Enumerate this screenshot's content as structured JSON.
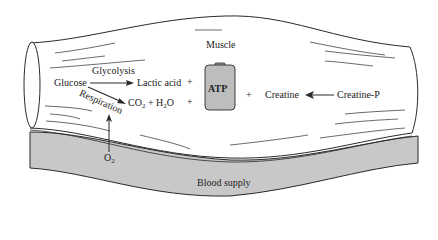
{
  "diagram": {
    "title": "Muscle",
    "colors": {
      "stroke": "#2a2a2a",
      "blood_fill": "#c8c8c8",
      "battery_fill": "#bdbdbd",
      "background": "#ffffff"
    },
    "labels": {
      "muscle": "Muscle",
      "glucose": "Glucose",
      "glycolysis": "Glycolysis",
      "lactic_acid": "Lactic acid",
      "respiration": "Respiration",
      "co2": "CO",
      "co2_sub": "2",
      "plus_h2o": " + H",
      "h2o_sub": "2",
      "h2o_tail": "O",
      "plus": "+",
      "atp": "ATP",
      "creatine": "Creatine",
      "creatine_p": "Creatine-P",
      "o2": "O",
      "o2_sub": "2",
      "blood_supply": "Blood supply"
    },
    "arrows": [
      {
        "from": "Glucose",
        "to": "Lactic acid",
        "label": "Glycolysis"
      },
      {
        "from": "Glucose",
        "to": "CO2 + H2O",
        "label": "Respiration"
      },
      {
        "from": "O2",
        "to": "Respiration"
      },
      {
        "from": "Creatine-P",
        "to": "Creatine"
      }
    ]
  }
}
